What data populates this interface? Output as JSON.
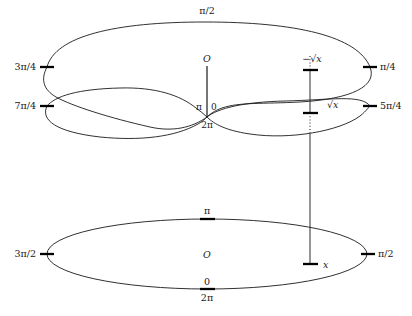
{
  "figure": {
    "caption": "Two-sheeted covering over the punctured complex plane with branch point at the origin",
    "colors": {
      "stroke": "#1a1a1a",
      "background": "#ffffff",
      "tick": "#000000"
    }
  },
  "upper_surface": {
    "name": "two-sheeted-riemann-surface",
    "center_label": "O",
    "branch_labels": {
      "left_of_branch": "π",
      "right_of_branch": "0",
      "below_branch": "2π"
    },
    "angle_labels": [
      {
        "text": "π/2",
        "position": "top-center"
      },
      {
        "text": "3π/4",
        "position": "left-upper-sheet"
      },
      {
        "text": "π/4",
        "position": "right-upper-sheet"
      },
      {
        "text": "7π/4",
        "position": "left-lower-sheet"
      },
      {
        "text": "5π/4",
        "position": "right-lower-sheet"
      }
    ],
    "fiber_points": [
      {
        "text": "−√x",
        "sheet": "upper"
      },
      {
        "text": "√x",
        "sheet": "lower"
      }
    ]
  },
  "lower_plane": {
    "name": "base-complex-plane",
    "center_label": "O",
    "angle_labels": [
      {
        "text": "π",
        "position": "top-center"
      },
      {
        "text": "3π/2",
        "position": "left"
      },
      {
        "text": "π/2",
        "position": "right"
      },
      {
        "text": "0",
        "position": "bottom-center-above"
      },
      {
        "text": "2π",
        "position": "bottom-center-below"
      }
    ],
    "point_label": "x"
  }
}
